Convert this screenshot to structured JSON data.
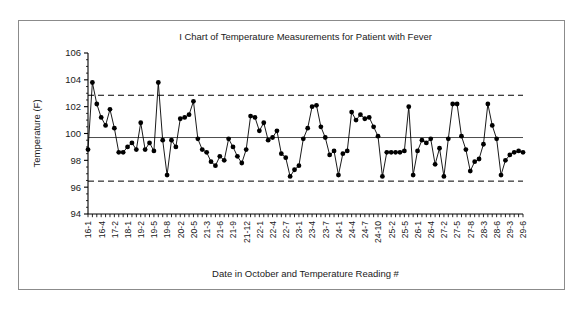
{
  "chart_data": {
    "type": "line",
    "title": "I Chart of Temperature Measurements for Patient with Fever",
    "xlabel": "Date in October and Temperature Reading #",
    "ylabel": "Temperature (F)",
    "ylim": [
      94,
      106
    ],
    "yticks": [
      94,
      96,
      98,
      100,
      102,
      104,
      106
    ],
    "grid": false,
    "legend": "none",
    "marker": "filled-circle",
    "line_color": "#000000",
    "center_line": {
      "label": "Center line",
      "value": 99.7,
      "style": "solid"
    },
    "upper_control_limit": {
      "label": "UCL",
      "value": 102.85,
      "style": "dashed"
    },
    "lower_control_limit": {
      "label": "LCL",
      "value": 96.45,
      "style": "dashed"
    },
    "xtick_labels": [
      "16-1",
      "16-4",
      "17-2",
      "18-1",
      "19-2",
      "19-5",
      "19-8",
      "20-2",
      "20-5",
      "21-3",
      "21-6",
      "21-9",
      "21-12",
      "22-1",
      "22-4",
      "22-7",
      "23-1",
      "23-4",
      "23-7",
      "24-1",
      "24-4",
      "24-7",
      "24-10",
      "25-2",
      "25-5",
      "26-1",
      "26-4",
      "27-2",
      "27-5",
      "27-8",
      "28-3",
      "28-6",
      "29-3",
      "29-6"
    ],
    "xtick_indices": [
      0,
      3,
      6,
      9,
      12,
      15,
      18,
      21,
      24,
      27,
      30,
      33,
      36,
      39,
      42,
      45,
      48,
      51,
      54,
      57,
      60,
      63,
      66,
      69,
      72,
      75,
      78,
      81,
      84,
      87,
      90,
      93,
      96,
      99
    ],
    "values": [
      98.8,
      103.8,
      102.2,
      101.2,
      100.6,
      101.8,
      100.4,
      98.6,
      98.6,
      99.0,
      99.3,
      98.8,
      100.8,
      98.8,
      99.3,
      98.7,
      103.8,
      99.5,
      96.9,
      99.5,
      99.0,
      101.1,
      101.2,
      101.4,
      102.4,
      99.6,
      98.8,
      98.6,
      97.9,
      97.6,
      98.3,
      98.0,
      99.6,
      99.0,
      98.3,
      97.8,
      98.8,
      101.3,
      101.2,
      100.2,
      100.8,
      99.5,
      99.7,
      100.2,
      98.5,
      98.2,
      96.8,
      97.3,
      97.6,
      99.6,
      100.4,
      102.0,
      102.1,
      100.5,
      99.7,
      98.4,
      98.7,
      96.9,
      98.5,
      98.7,
      101.6,
      101.0,
      101.4,
      101.1,
      101.2,
      100.5,
      99.8,
      96.8,
      98.6,
      98.6,
      98.6,
      98.6,
      98.7,
      102.0,
      96.9,
      98.7,
      99.5,
      99.3,
      99.6,
      97.7,
      98.9,
      96.8,
      99.6,
      102.2,
      102.2,
      99.8,
      98.8,
      97.2,
      97.9,
      98.1,
      99.2,
      102.2,
      100.6,
      99.6,
      96.9,
      98.0,
      98.4,
      98.6,
      98.7,
      98.6
    ]
  }
}
